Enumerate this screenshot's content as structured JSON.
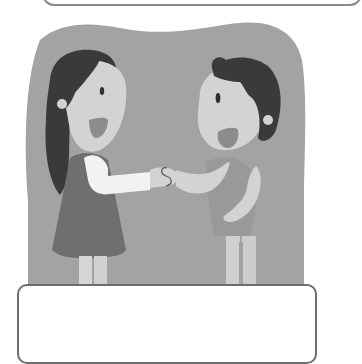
{
  "illustration": {
    "subject": "two children shaking hands",
    "figures": [
      {
        "role": "girl",
        "position": "left"
      },
      {
        "role": "boy",
        "position": "right"
      }
    ],
    "colors": {
      "background_blob": "#a3a3a3",
      "hair": "#3a3a3a",
      "skin": "#d3d3d3",
      "girl_sleeve": "#f2f2f2",
      "girl_dress": "#6f6f6f",
      "boy_shirt": "#999999",
      "mouth": "#8c8c8c",
      "legs": "#d0d0d0",
      "box_border": "#707070"
    }
  },
  "caption_box": {
    "text": ""
  }
}
